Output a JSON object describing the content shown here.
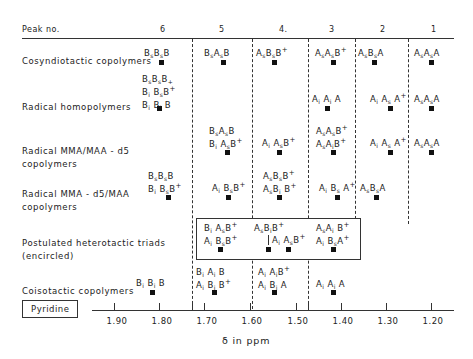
{
  "header": {
    "label": "Peak no.",
    "peaks": [
      "6",
      "5",
      "4.",
      "3",
      "2",
      "1"
    ]
  },
  "rows": [
    {
      "label": [
        "Cosyndiotactic copolymers"
      ]
    },
    {
      "label": [
        "Radical homopolymers"
      ]
    },
    {
      "label": [
        "Radical MMA/MAA - d5",
        "copolymers"
      ]
    },
    {
      "label": [
        "Radical MMA - d5/MAA",
        "copolymers"
      ]
    },
    {
      "label": [
        "Postulated heterotactic triads",
        "(encircled)"
      ]
    },
    {
      "label": [
        "Coisotactic copolymers"
      ]
    }
  ],
  "solvent_box": "Pyridine",
  "axis": {
    "ticks": [
      "1.90",
      "1.80",
      "1.70",
      "1.60",
      "1.50",
      "1.40",
      "1.30",
      "1.20"
    ],
    "label": "δ in ppm"
  },
  "triads": {
    "cosyn": [
      "BsBsB",
      "BsAsB",
      "AsBsB+",
      "AsAsB+",
      "AsBsA",
      "AsAsA"
    ],
    "homo": [
      "BsBsB+ / BiBsB+ / BiBiB",
      "AiAiA",
      "AiAsA+",
      "AsAsA"
    ],
    "mma_d5_a": [
      "BsAsB / BiAsB+",
      "AiAsB+",
      "AsAsB+ / AsAiB+",
      "AiAsA+",
      "AsAsA"
    ],
    "mma_d5_b": [
      "BsBsB / BiBsB+",
      "AiBsB+",
      "AsBsB+ / AsBiB+",
      "AiBsA+",
      "AsBsA"
    ],
    "hetero": [
      "BiAsB+ / AiBsB+",
      "AsBiB+",
      "AiAsB+",
      "AsAiB+ / AiBsA+"
    ],
    "coiso": [
      "BiBiB",
      "BiAiB / AiBiB+",
      "AiAiB+ / AiBiA",
      "AiAiA"
    ]
  }
}
